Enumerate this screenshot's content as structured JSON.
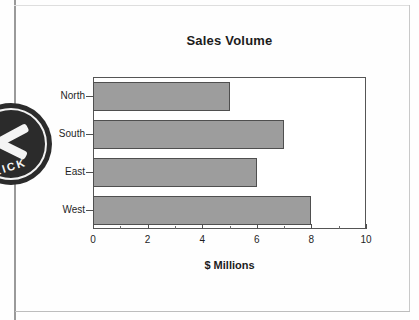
{
  "page": {
    "logo": {
      "text": "RICK"
    }
  },
  "chart_data": {
    "type": "bar",
    "orientation": "horizontal",
    "title": "Sales Volume",
    "xlabel": "$ Millions",
    "ylabel": "",
    "categories": [
      "North",
      "South",
      "East",
      "West"
    ],
    "values": [
      5,
      7,
      6,
      8
    ],
    "xlim": [
      0,
      10
    ],
    "xticks": [
      0,
      2,
      4,
      6,
      8,
      10
    ],
    "xtick_labels": [
      "0",
      "2",
      "4",
      "6",
      "8",
      "10"
    ],
    "xminor_ticks": [
      1,
      3,
      5,
      7,
      9
    ],
    "grid": false,
    "legend": false,
    "bar_color": "#9d9d9d",
    "bar_edge_color": "#4f4f4f",
    "frame_color": "#555555",
    "background": "#ffffff"
  }
}
